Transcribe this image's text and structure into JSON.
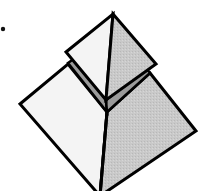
{
  "figure": {
    "title": "",
    "colors": {
      "background": "#ffffff",
      "outline": "#000000",
      "light_face": "#f4f4f4",
      "shaded_face": "#c8c8c8",
      "band": "#9a9a9a",
      "dot": "#111111"
    },
    "parts": [
      {
        "name": "top-pyramid-left-face",
        "fill": "light_face"
      },
      {
        "name": "top-pyramid-right-face",
        "fill": "shaded_face"
      },
      {
        "name": "middle-band-left",
        "fill": "band"
      },
      {
        "name": "middle-band-right",
        "fill": "band"
      },
      {
        "name": "base-left-face",
        "fill": "light_face"
      },
      {
        "name": "base-right-face",
        "fill": "shaded_face"
      },
      {
        "name": "bullet-dot",
        "fill": "dot"
      }
    ]
  }
}
